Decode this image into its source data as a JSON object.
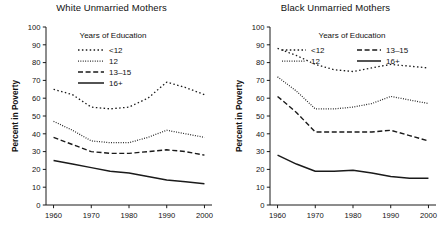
{
  "figure": {
    "axis_y_label": "Percent in Poverty",
    "legend_title": "Years of Education",
    "y_ticks": [
      0,
      10,
      20,
      30,
      40,
      50,
      60,
      70,
      80,
      90,
      100
    ],
    "x_ticks": [
      1960,
      1970,
      1980,
      1990,
      2000
    ],
    "series_names": [
      "<12",
      "12",
      "13–15",
      "16+"
    ],
    "line_color": "#1a1a1a"
  },
  "chart_data": [
    {
      "type": "line",
      "title": "White Unmarried Mothers",
      "xlabel": "",
      "ylabel": "Percent in Poverty",
      "xlim": [
        1958,
        2002
      ],
      "ylim": [
        0,
        100
      ],
      "xticks": [
        1960,
        1970,
        1980,
        1990,
        2000
      ],
      "yticks": [
        0,
        10,
        20,
        30,
        40,
        50,
        60,
        70,
        80,
        90,
        100
      ],
      "grid": false,
      "legend_position": "upper-left-inside",
      "legend_title": "Years of Education",
      "x": [
        1960,
        1965,
        1970,
        1975,
        1980,
        1985,
        1990,
        1995,
        2000
      ],
      "series": [
        {
          "name": "<12",
          "dash": "dotted-coarse",
          "values": [
            65,
            62,
            55,
            54,
            55,
            60,
            69,
            66,
            62
          ]
        },
        {
          "name": "12",
          "dash": "dotted-fine",
          "values": [
            47,
            42,
            36,
            35,
            35,
            38,
            42,
            40,
            38
          ]
        },
        {
          "name": "13–15",
          "dash": "dashed",
          "values": [
            38,
            34,
            30,
            29,
            29,
            30,
            31,
            30,
            28
          ]
        },
        {
          "name": "16+",
          "dash": "solid",
          "values": [
            25,
            23,
            21,
            19,
            18,
            16,
            14,
            13,
            12
          ]
        }
      ]
    },
    {
      "type": "line",
      "title": "Black Unmarried Mothers",
      "xlabel": "",
      "ylabel": "Percent in Poverty",
      "xlim": [
        1958,
        2002
      ],
      "ylim": [
        0,
        100
      ],
      "xticks": [
        1960,
        1970,
        1980,
        1990,
        2000
      ],
      "yticks": [
        0,
        10,
        20,
        30,
        40,
        50,
        60,
        70,
        80,
        90,
        100
      ],
      "grid": false,
      "legend_position": "upper-center-inside",
      "legend_title": "Years of Education",
      "x": [
        1960,
        1965,
        1970,
        1975,
        1980,
        1985,
        1990,
        1995,
        2000
      ],
      "series": [
        {
          "name": "<12",
          "dash": "dotted-coarse",
          "values": [
            88,
            84,
            79,
            76,
            75,
            77,
            79,
            78,
            77
          ]
        },
        {
          "name": "12",
          "dash": "dotted-fine",
          "values": [
            72,
            64,
            54,
            54,
            55,
            57,
            61,
            59,
            57
          ]
        },
        {
          "name": "13–15",
          "dash": "dashed",
          "values": [
            61,
            52,
            41,
            41,
            41,
            41,
            42,
            39,
            36
          ]
        },
        {
          "name": "16+",
          "dash": "solid",
          "values": [
            28,
            23,
            19,
            19,
            19.5,
            18,
            16,
            15,
            15
          ]
        }
      ]
    }
  ]
}
